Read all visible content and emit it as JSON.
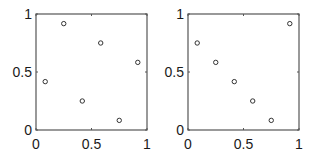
{
  "chart_data": [
    {
      "type": "scatter",
      "title": "",
      "xlabel": "",
      "ylabel": "",
      "xlim": [
        0,
        1
      ],
      "ylim": [
        0,
        1
      ],
      "grid": false,
      "marker": "open-circle",
      "x_ticks": [
        "0",
        "0.5",
        "1"
      ],
      "y_ticks": [
        "0",
        "0.5",
        "1"
      ],
      "points": [
        {
          "x": 0.083,
          "y": 0.417
        },
        {
          "x": 0.25,
          "y": 0.917
        },
        {
          "x": 0.417,
          "y": 0.25
        },
        {
          "x": 0.583,
          "y": 0.75
        },
        {
          "x": 0.75,
          "y": 0.083
        },
        {
          "x": 0.917,
          "y": 0.583
        }
      ]
    },
    {
      "type": "scatter",
      "title": "",
      "xlabel": "",
      "ylabel": "",
      "xlim": [
        0,
        1
      ],
      "ylim": [
        0,
        1
      ],
      "grid": false,
      "marker": "open-circle",
      "x_ticks": [
        "0",
        "0.5",
        "1"
      ],
      "y_ticks": [
        "0",
        "0.5",
        "1"
      ],
      "points": [
        {
          "x": 0.083,
          "y": 0.75
        },
        {
          "x": 0.25,
          "y": 0.583
        },
        {
          "x": 0.417,
          "y": 0.417
        },
        {
          "x": 0.583,
          "y": 0.25
        },
        {
          "x": 0.75,
          "y": 0.083
        },
        {
          "x": 0.917,
          "y": 0.917
        }
      ]
    }
  ],
  "style": {
    "axis_color": "#555555",
    "marker_color": "#333333"
  }
}
